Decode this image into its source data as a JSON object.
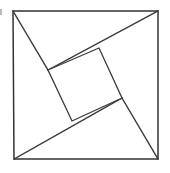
{
  "figure": {
    "background_color": "#ffffff",
    "stroke_color": "#333333",
    "fill_color": "#ffffff",
    "artifact_color": "#b9b9b9",
    "canvas": {
      "width": 170,
      "height": 173
    }
  },
  "shapes": {
    "outer_square": {
      "name": "outer-square",
      "points": "13,11 158,11 158,159 14,159",
      "vertices": [
        {
          "label": "top-left",
          "x": 13,
          "y": 11
        },
        {
          "label": "top-right",
          "x": 158,
          "y": 11
        },
        {
          "label": "bottom-right",
          "x": 158,
          "y": 159
        },
        {
          "label": "bottom-left",
          "x": 14,
          "y": 159
        }
      ]
    },
    "inner_square": {
      "name": "inner-tilted-square",
      "points": "48,70 99,48 122,98 72,121",
      "vertices": [
        {
          "label": "left",
          "x": 48,
          "y": 70
        },
        {
          "label": "top",
          "x": 99,
          "y": 48
        },
        {
          "label": "right",
          "x": 122,
          "y": 98
        },
        {
          "label": "bottom",
          "x": 72,
          "y": 121
        }
      ]
    }
  },
  "spokes": [
    {
      "name": "spoke-top-left",
      "from_x": 13,
      "from_y": 11,
      "to_x": 48,
      "to_y": 70,
      "path": "M13,11 L48,70"
    },
    {
      "name": "spoke-top-right",
      "from_x": 48,
      "from_y": 70,
      "to_x": 158,
      "to_y": 11,
      "path": "M48,70 L158,11"
    },
    {
      "name": "spoke-bottom-left",
      "from_x": 14,
      "from_y": 159,
      "to_x": 122,
      "to_y": 98,
      "path": "M14,159 L122,98"
    },
    {
      "name": "spoke-bottom-right",
      "from_x": 122,
      "from_y": 98,
      "to_x": 158,
      "to_y": 159,
      "path": "M122,98 L158,159"
    }
  ],
  "artifact": {
    "name": "scan-speck",
    "x": 0,
    "y": 9,
    "width": 2,
    "height": 6
  }
}
